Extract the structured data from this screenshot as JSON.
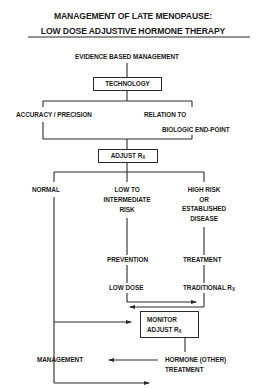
{
  "title": {
    "line1": "MANAGEMENT OF LATE MENOPAUSE:",
    "line2": "LOW DOSE ADJUSTIVE HORMONE THERAPY"
  },
  "nodes": {
    "evidence": "EVIDENCE BASED MANAGEMENT",
    "technology": "TECHNOLOGY",
    "accuracy": "ACCURACY / PRECISION",
    "relation_line1": "RELATION TO",
    "relation_line2": "BIOLOGIC END-POINT",
    "adjust": "ADJUST R",
    "adjust_sub": "X",
    "normal": "NORMAL",
    "low_risk_line1": "LOW TO",
    "low_risk_line2": "INTERMEDIATE",
    "low_risk_line3": "RISK",
    "high_risk_line1": "HIGH RISK",
    "high_risk_line2": "OR",
    "high_risk_line3": "ESTABLISHED",
    "high_risk_line4": "DISEASE",
    "prevention": "PREVENTION",
    "treatment": "TREATMENT",
    "low_dose": "LOW DOSE",
    "traditional": "TRADITIONAL R",
    "traditional_sub": "X",
    "monitor_line1": "MONITOR",
    "monitor_line2": "ADJUST R",
    "monitor_sub": "X",
    "management": "MANAGEMENT",
    "hormone_line1": "HORMONE (OTHER)",
    "hormone_line2": "TREATMENT"
  }
}
